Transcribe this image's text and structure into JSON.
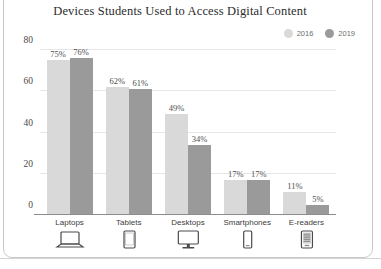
{
  "chart_data": {
    "type": "bar",
    "title": "Devices Students Used to Access Digital Content",
    "xlabel": "",
    "ylabel": "",
    "categories": [
      "Laptops",
      "Tablets",
      "Desktops",
      "Smartphones",
      "E-readers"
    ],
    "category_icons": [
      "laptop-icon",
      "tablet-icon",
      "desktop-monitor-icon",
      "smartphone-icon",
      "ereader-icon"
    ],
    "series": [
      {
        "name": "2016",
        "color": "#d9d9d9",
        "values": [
          75,
          62,
          49,
          17,
          11
        ],
        "value_labels": [
          "75%",
          "62%",
          "49%",
          "17%",
          "11%"
        ]
      },
      {
        "name": "2019",
        "color": "#9a9a9a",
        "values": [
          76,
          61,
          34,
          17,
          5
        ],
        "value_labels": [
          "76%",
          "61%",
          "34%",
          "17%",
          "5%"
        ]
      }
    ],
    "ylim": [
      0,
      80
    ],
    "yticks": [
      0,
      20,
      40,
      60,
      80
    ],
    "ytick_labels": [
      "0",
      "20",
      "40",
      "60",
      "80"
    ],
    "grid": true,
    "legend_position": "top-right"
  },
  "colors": {
    "series_2016": "#d9d9d9",
    "series_2019": "#9a9a9a",
    "grid": "#e6e6e6",
    "axis": "#8c8c8c",
    "title_text": "#2b2b2b",
    "frame": "#c9c9c9"
  }
}
